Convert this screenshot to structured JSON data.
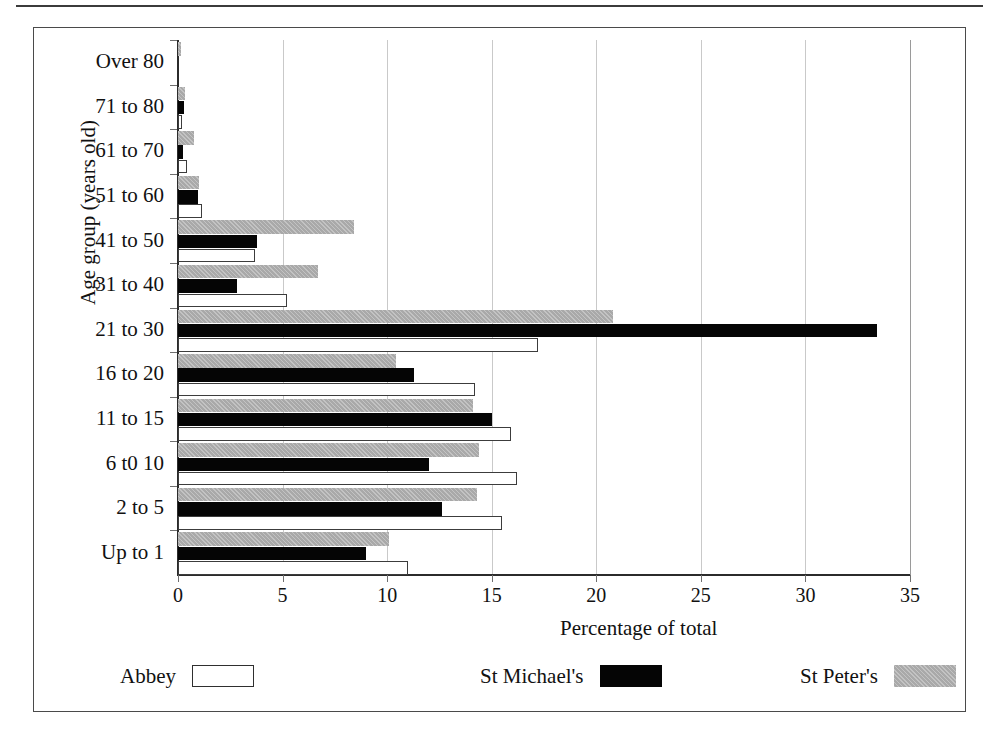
{
  "chart_data": {
    "type": "bar",
    "orientation": "horizontal",
    "title": "",
    "xlabel": "Percentage of total",
    "ylabel": "Age group (years old)",
    "xlim": [
      0,
      35
    ],
    "xticks": [
      0,
      5,
      10,
      15,
      20,
      25,
      30,
      35
    ],
    "xtick_labels": [
      "0",
      "5",
      "10",
      "15",
      "20",
      "25",
      "30",
      "35"
    ],
    "grid": "vertical",
    "legend_position": "bottom",
    "categories": [
      "Over 80",
      "71 to 80",
      "61 to 70",
      "51 to 60",
      "41 to 50",
      "31 to 40",
      "21 to 30",
      "16 to 20",
      "11 to 15",
      "6 t0 10",
      "2 to 5",
      "Up to 1"
    ],
    "series": [
      {
        "name": "Abbey",
        "style": "white-outline",
        "color": "#ffffff",
        "values": [
          0.0,
          0.2,
          0.45,
          1.15,
          3.7,
          5.2,
          17.2,
          14.2,
          15.9,
          16.2,
          15.5,
          11.0
        ]
      },
      {
        "name": "St Michael's",
        "style": "solid-black",
        "color": "#050505",
        "values": [
          0.0,
          0.3,
          0.25,
          0.95,
          3.8,
          2.8,
          33.4,
          11.3,
          15.0,
          12.0,
          12.6,
          9.0
        ]
      },
      {
        "name": "St Peter's",
        "style": "grey-hatch",
        "color": "#a9a9a9",
        "values": [
          0.15,
          0.35,
          0.75,
          1.0,
          8.4,
          6.7,
          20.8,
          10.4,
          14.1,
          14.4,
          14.3,
          10.1
        ]
      }
    ]
  },
  "legend": {
    "entries": [
      {
        "label": "Abbey",
        "swatch": "abbey"
      },
      {
        "label": "St Michael's",
        "swatch": "michaels"
      },
      {
        "label": "St Peter's",
        "swatch": "peters"
      }
    ]
  },
  "axis": {
    "x_title": "Percentage of total",
    "y_title": "Age group (years old)"
  }
}
